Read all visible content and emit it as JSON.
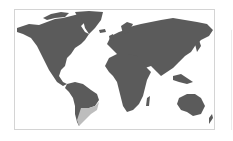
{
  "map": {
    "type": "world-choropleth",
    "land_color": "#5b5b5b",
    "highlight_color": "#bdbdbd",
    "border_color": "#d4d4d4",
    "highlighted_regions": [
      "Argentina",
      "Uruguay"
    ]
  }
}
